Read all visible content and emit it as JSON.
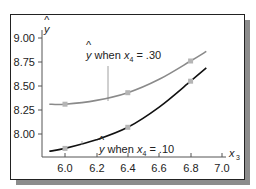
{
  "chart_data": {
    "type": "line",
    "title": "",
    "xlabel": "x3",
    "ylabel": "ŷ",
    "xlim": [
      5.9,
      7.0
    ],
    "ylim": [
      7.8,
      9.05
    ],
    "x_ticks": [
      "6.0",
      "6.2",
      "6.4",
      "6.6",
      "6.8",
      "7.0"
    ],
    "y_ticks": [
      "8.00",
      "8.25",
      "8.50",
      "8.75",
      "9.00"
    ],
    "grid": false,
    "legend": "inline annotations",
    "series": [
      {
        "name": "ŷ when x4 = .30",
        "color": "#8a8a8a",
        "x": [
          5.9,
          6.0,
          6.2,
          6.4,
          6.6,
          6.8,
          6.9
        ],
        "values": [
          8.31,
          8.31,
          8.35,
          8.43,
          8.57,
          8.76,
          8.86
        ],
        "markers": {
          "x": [
            6.0,
            6.4,
            6.8
          ],
          "y": [
            8.31,
            8.43,
            8.76
          ]
        }
      },
      {
        "name": "ŷ when x4 = .10",
        "color": "#111111",
        "x": [
          5.9,
          6.0,
          6.2,
          6.4,
          6.6,
          6.8,
          6.9
        ],
        "values": [
          7.82,
          7.85,
          7.94,
          8.07,
          8.28,
          8.55,
          8.69
        ],
        "markers": {
          "x": [
            6.0,
            6.4,
            6.8
          ],
          "y": [
            7.85,
            8.07,
            8.55
          ]
        }
      }
    ],
    "annotations": [
      {
        "text": "ŷ when x4 = .30",
        "target_series": 0
      },
      {
        "text": "ŷ when x4 = .10",
        "target_series": 1
      }
    ]
  },
  "axes": {
    "y_label_hat": "^",
    "y_label": "y",
    "x_label": "x",
    "x_label_sub": "3"
  },
  "annotations": {
    "upper": {
      "hat": "^",
      "y": "y",
      "when": " when ",
      "x": "x",
      "sub": "4",
      "eq": " = .30"
    },
    "lower": {
      "hat": "^",
      "y": "y",
      "when": " when ",
      "x": "x",
      "sub": "4",
      "eq": " = .10"
    }
  },
  "colors": {
    "frame": "#222222",
    "shadow": "#8c8c8c",
    "upper_curve": "#8a8a8a",
    "lower_curve": "#111111",
    "marker": "#b5b5b5"
  }
}
